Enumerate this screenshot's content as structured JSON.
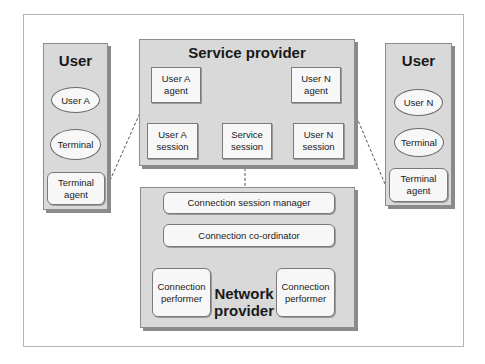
{
  "diagram": {
    "left_user": {
      "title": "User",
      "user": "User A",
      "terminal": "Terminal",
      "terminal_agent": "Terminal\nagent"
    },
    "service_provider": {
      "title": "Service provider",
      "user_a_agent": "User A\nagent",
      "user_n_agent": "User N\nagent",
      "user_a_session": "User A\nsession",
      "service_session": "Service\nsession",
      "user_n_session": "User N\nsession"
    },
    "network_provider": {
      "title": "Network\nprovider",
      "connection_session_manager": "Connection session manager",
      "connection_coordinator": "Connection co-ordinator",
      "connection_performer_left": "Connection\nperformer",
      "connection_performer_right": "Connection\nperformer"
    },
    "right_user": {
      "title": "User",
      "user": "User N",
      "terminal": "Terminal",
      "terminal_agent": "Terminal\nagent"
    },
    "colors": {
      "panel_fill": "#d9d9d9",
      "box_fill": "#f7f7f7",
      "border": "#7a7a7a",
      "shadow": "#8a8a8a"
    }
  }
}
